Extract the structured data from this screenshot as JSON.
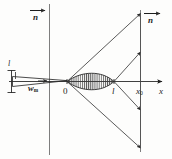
{
  "figure": {
    "kind": "optics-ray-diagram",
    "caption": "",
    "colors": {
      "ink": "#1d1d1d",
      "line": "#2a2a2a",
      "hatch": "#3a3a3a",
      "background": "#fdfdfc",
      "faint": "#6b6b6b"
    },
    "labels": {
      "n_left": "n",
      "n_right": "n",
      "origin": "0",
      "focus": "l",
      "x_sub": "x",
      "x_sub_index": "0",
      "axis_x": "x",
      "waist": "w",
      "waist_index": "m",
      "left_aperture": "l"
    },
    "axes": {
      "x_axis_label": "x",
      "origin_label": "0",
      "marker_labels": [
        "0",
        "l",
        "x0"
      ]
    },
    "annotations": [
      {
        "name": "left-index-arrow",
        "label": "n",
        "description": "arrow with refractive index n at upper left"
      },
      {
        "name": "right-index-arrow",
        "label": "n",
        "description": "arrow with refractive index n at upper right"
      },
      {
        "name": "beam-waist",
        "label": "w",
        "sub": "m",
        "description": "minimum beam waist marker left of origin"
      },
      {
        "name": "lens-region",
        "label": "",
        "description": "hatched lens-shaped region between 0 and l"
      },
      {
        "name": "screen-plane",
        "label": "x0",
        "description": "vertical plane at x0"
      }
    ]
  }
}
